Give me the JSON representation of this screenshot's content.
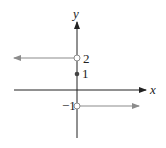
{
  "diagram": {
    "axes": {
      "x_label": "x",
      "y_label": "y"
    },
    "points": [
      {
        "label": "2",
        "y_value": 2,
        "type": "open"
      },
      {
        "label": "1",
        "y_value": 1,
        "type": "closed"
      },
      {
        "label": "−1",
        "y_value": -1,
        "type": "open"
      }
    ],
    "rays": [
      {
        "from_y": 2,
        "direction": "left",
        "start": "open"
      },
      {
        "from_y": -1,
        "direction": "right",
        "start": "open"
      }
    ],
    "colors": {
      "axis": "#222222",
      "graph": "#8c8c8c"
    }
  }
}
